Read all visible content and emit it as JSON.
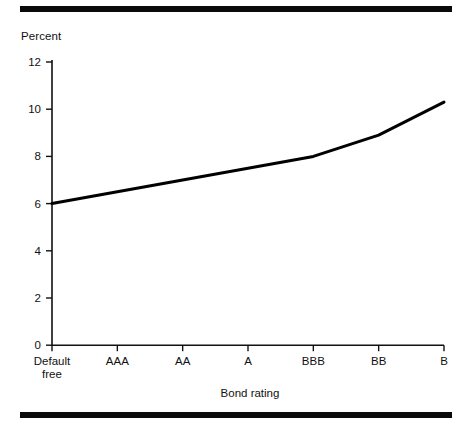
{
  "figure": {
    "top_rule": "decorative-rule",
    "bottom_rule": "decorative-rule"
  },
  "chart_data": {
    "type": "line",
    "title": "",
    "subtitle": "",
    "ylabel": "Percent",
    "xlabel": "Bond rating",
    "categories": [
      "Default free",
      "AAA",
      "AA",
      "A",
      "BBB",
      "BB",
      "B"
    ],
    "category_lines": [
      [
        "Default",
        "free"
      ],
      [
        "AAA"
      ],
      [
        "AA"
      ],
      [
        "A"
      ],
      [
        "BBB"
      ],
      [
        "BB"
      ],
      [
        "B"
      ]
    ],
    "values": [
      6.0,
      6.5,
      7.0,
      7.5,
      8.0,
      8.9,
      10.3
    ],
    "series": [
      {
        "name": "Yield",
        "values": [
          6.0,
          6.5,
          7.0,
          7.5,
          8.0,
          8.9,
          10.3
        ],
        "color": "#000000"
      }
    ],
    "ylim": [
      0,
      12
    ],
    "yticks": [
      0,
      2,
      4,
      6,
      8,
      10,
      12
    ],
    "ytick_labels": [
      "0",
      "2",
      "4",
      "6",
      "8",
      "10",
      "12"
    ],
    "grid": false,
    "legend": "none",
    "line_width": 3,
    "axis_color": "#111111"
  },
  "axis": {
    "y_title": "Percent",
    "x_title": "Bond rating"
  }
}
